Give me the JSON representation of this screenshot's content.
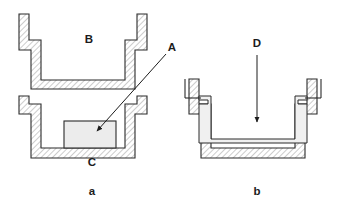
{
  "figure": {
    "background_color": "#ffffff",
    "line_color": "#2b2b2b",
    "hatch_color": "#8a8a8a",
    "fill_light": "#ececec",
    "fill_lighter": "#f2f2f2",
    "panels": [
      {
        "id": "panel-a",
        "caption": "a",
        "caption_x": 92,
        "caption_y": 192,
        "description": "Upper open channel section above a lower channel section containing an inserted block"
      },
      {
        "id": "panel-b",
        "caption": "b",
        "caption_x": 257,
        "caption_y": 192,
        "description": "Channel section with inner lining and a downward arrow"
      }
    ],
    "callouts": [
      {
        "id": "callout-b",
        "label": "B",
        "x": 89,
        "y": 40,
        "has_leader": false,
        "panel": "panel-a"
      },
      {
        "id": "callout-a",
        "label": "A",
        "x": 172,
        "y": 48,
        "has_leader": true,
        "leader_from_x": 166,
        "leader_from_y": 54,
        "leader_to_x": 97,
        "leader_to_y": 131,
        "panel": "panel-a"
      },
      {
        "id": "callout-c",
        "label": "C",
        "x": 92,
        "y": 163,
        "has_leader": false,
        "panel": "panel-a"
      },
      {
        "id": "callout-d",
        "label": "D",
        "x": 257,
        "y": 44,
        "has_leader": true,
        "leader_from_x": 257,
        "leader_from_y": 55,
        "leader_to_x": 257,
        "leader_to_y": 122,
        "panel": "panel-b"
      }
    ]
  }
}
